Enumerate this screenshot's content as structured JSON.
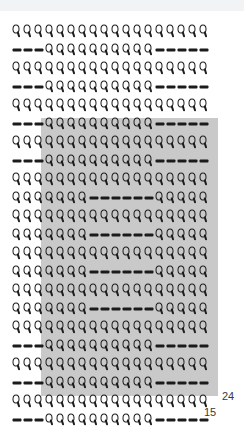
{
  "canvas": {
    "width": 244,
    "height": 428,
    "background": "#ffffff"
  },
  "top_strip": {
    "present": true,
    "color": "#f2f3f4",
    "height": 11,
    "note": "faint cut-off content strip at top edge"
  },
  "grid": {
    "columns": 18,
    "rows": 21,
    "cell_width": 11,
    "cell_height": 18.5,
    "origin_x": 11,
    "origin_y": 22,
    "glyph_colors": {
      "marker": "#1b1b1b",
      "dash": "#1b1b1b"
    },
    "glyph_names": {
      "Q": "drop-marker-icon",
      "-": "dash-icon"
    },
    "legend": [
      {
        "symbol": "Q",
        "name": "drop-marker-icon",
        "meaning": "filled cell"
      },
      {
        "symbol": "-",
        "name": "dash-icon",
        "meaning": "empty cell"
      }
    ],
    "cells": [
      "QQQQQQQQQQQQQQQQQQ",
      "---QQQQQQQQQQ-----",
      "QQQQQQQQQQQQQQQQQQ",
      "---QQQQQQQQQQ-----",
      "QQQQQQQQQQQQQQQQQQ",
      "---QQQQQQQQQQ-----",
      "QQQQQQQQQQQQQQQQQQ",
      "---QQQQQQQQQQ-----",
      "QQQQQQQQQQQQQQQQQQ",
      "QQQQQQQ------QQQQQ",
      "QQQQQQQQQQQQQQQQQQ",
      "QQQQQQQ------QQQQQ",
      "QQQQQQQQQQQQQQQQQQ",
      "QQQQQQQ------QQQQQ",
      "QQQQQQQQQQQQQQQQQQ",
      "QQQQQQQ------QQQQQ",
      "QQQQQQQQQQQQQQQQQQ",
      "---QQQQQQQQQQ-----",
      "QQQQQQQQQQQQQQQQQQ",
      "---QQQQQQQQQQ-----",
      "QQQQQQQQQQQQQQQQQQ",
      "---QQQQQQQQQQ-----"
    ]
  },
  "highlight": {
    "color": "#c9c9c9",
    "x": 41,
    "y": 118,
    "width": 177,
    "height": 278,
    "start_column": 4,
    "end_column": 18,
    "start_row": 9,
    "end_row": 21
  },
  "labels": {
    "right": "24",
    "bottom": "15"
  }
}
